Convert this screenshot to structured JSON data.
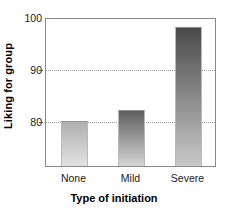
{
  "chart_data": {
    "type": "bar",
    "title": "",
    "categories": [
      "None",
      "Mild",
      "Severe"
    ],
    "values": [
      80,
      82,
      98
    ],
    "xlabel": "Type of initiation",
    "ylabel": "Liking for group",
    "ylim": [
      71.3,
      100
    ],
    "yticks": [
      80,
      90,
      100
    ],
    "ytick_labels": [
      "80",
      "90",
      "100"
    ],
    "grid": "horizontal-dotted-at-80-and-90",
    "legend": "none",
    "series": [
      {
        "name": "Liking for group",
        "values": [
          80,
          82,
          98
        ]
      }
    ],
    "bar_styles": [
      {
        "category": "None",
        "top_color": "#b0b0b0",
        "bottom_color": "#e2e2e2"
      },
      {
        "category": "Mild",
        "top_color": "#5e5e5e",
        "bottom_color": "#d6d6d6"
      },
      {
        "category": "Severe",
        "top_color": "#4a4a4a",
        "bottom_color": "#c9c9c9"
      }
    ],
    "colors": {
      "axis": "#8a8a8a",
      "grid": "#9a9a9a",
      "text": "#1a1a1a",
      "background": "#ffffff"
    }
  }
}
